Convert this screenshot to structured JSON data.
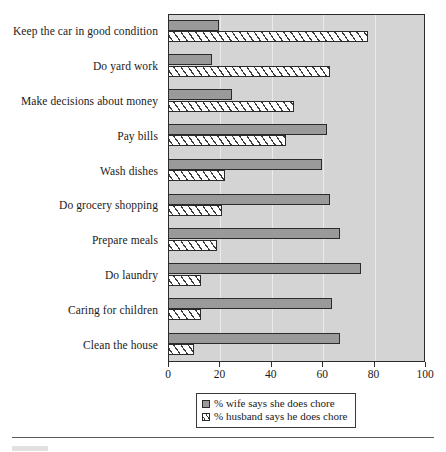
{
  "chart_data": {
    "type": "bar",
    "orientation": "horizontal",
    "title": "",
    "xlabel": "",
    "ylabel": "",
    "xlim": [
      0,
      100
    ],
    "xticks": [
      0,
      20,
      40,
      60,
      80,
      100
    ],
    "grid": true,
    "legend_position": "bottom-center",
    "categories": [
      "Keep the car in good condition",
      "Do yard work",
      "Make decisions about money",
      "Pay bills",
      "Wash dishes",
      "Do grocery shopping",
      "Prepare meals",
      "Do laundry",
      "Caring for children",
      "Clean the house"
    ],
    "series": [
      {
        "name": "% wife says she does chore",
        "style": "solid-gray",
        "color": "#9a9a9a",
        "values": [
          20,
          17,
          25,
          62,
          60,
          63,
          67,
          75,
          64,
          67
        ]
      },
      {
        "name": "% husband says he does chore",
        "style": "hatched",
        "color": "#ffffff",
        "values": [
          78,
          63,
          49,
          46,
          22,
          21,
          19,
          13,
          13,
          10
        ]
      }
    ]
  },
  "legend": {
    "entries": [
      {
        "label": "% wife says she does chore"
      },
      {
        "label": "% husband says he does chore"
      }
    ]
  },
  "colors": {
    "plot_background": "#d4d4d4",
    "axis": "#2b2b2b",
    "gridline": "#eceaea",
    "wife_bar": "#9a9a9a",
    "husband_bar": "#ffffff",
    "page_background": "#ffffff"
  }
}
